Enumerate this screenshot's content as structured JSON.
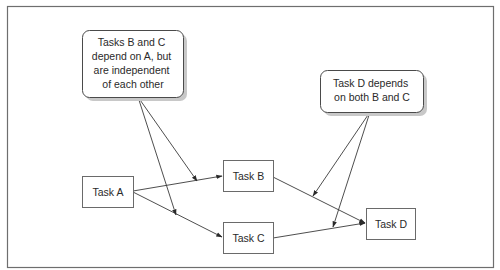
{
  "diagram": {
    "type": "task-dependency-graph",
    "nodes": [
      {
        "id": "A",
        "label": "Task A"
      },
      {
        "id": "B",
        "label": "Task B"
      },
      {
        "id": "C",
        "label": "Task C"
      },
      {
        "id": "D",
        "label": "Task D"
      }
    ],
    "edges": [
      {
        "from": "A",
        "to": "B"
      },
      {
        "from": "A",
        "to": "C"
      },
      {
        "from": "B",
        "to": "D"
      },
      {
        "from": "C",
        "to": "D"
      }
    ],
    "callouts": [
      {
        "id": "callout-bc",
        "lines": [
          "Tasks B and C",
          "depend on A, but",
          "are independent",
          "of each other"
        ],
        "points_to": [
          "edge A-B",
          "edge A-C"
        ]
      },
      {
        "id": "callout-d",
        "lines": [
          "Task D depends",
          "on both B and C"
        ],
        "points_to": [
          "edge B-D",
          "edge C-D"
        ]
      }
    ],
    "colors": {
      "border": "#6e6e6e",
      "line": "#3a3a3a",
      "shadow": "#c8c8c8",
      "text": "#2a2a2a"
    }
  }
}
